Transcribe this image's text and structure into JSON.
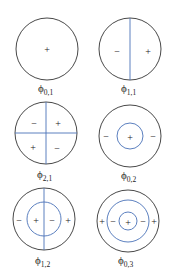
{
  "figure": {
    "node_color": "#4a72b8",
    "outline_color": "#333333",
    "modes": [
      {
        "label": "ϕ",
        "subscript": "0,1",
        "signs": [
          "+"
        ]
      },
      {
        "label": "ϕ",
        "subscript": "1,1",
        "signs": [
          "−",
          "+"
        ]
      },
      {
        "label": "ϕ",
        "subscript": "2,1",
        "signs": [
          "−",
          "+",
          "+",
          "−"
        ]
      },
      {
        "label": "ϕ",
        "subscript": "0,2",
        "signs": [
          "−",
          "+",
          "−"
        ]
      },
      {
        "label": "ϕ",
        "subscript": "1,2",
        "signs": [
          "−",
          "+",
          "−",
          "+"
        ]
      },
      {
        "label": "ϕ",
        "subscript": "0,3",
        "signs": [
          "+",
          "−",
          "+",
          "−",
          "+"
        ]
      }
    ]
  }
}
